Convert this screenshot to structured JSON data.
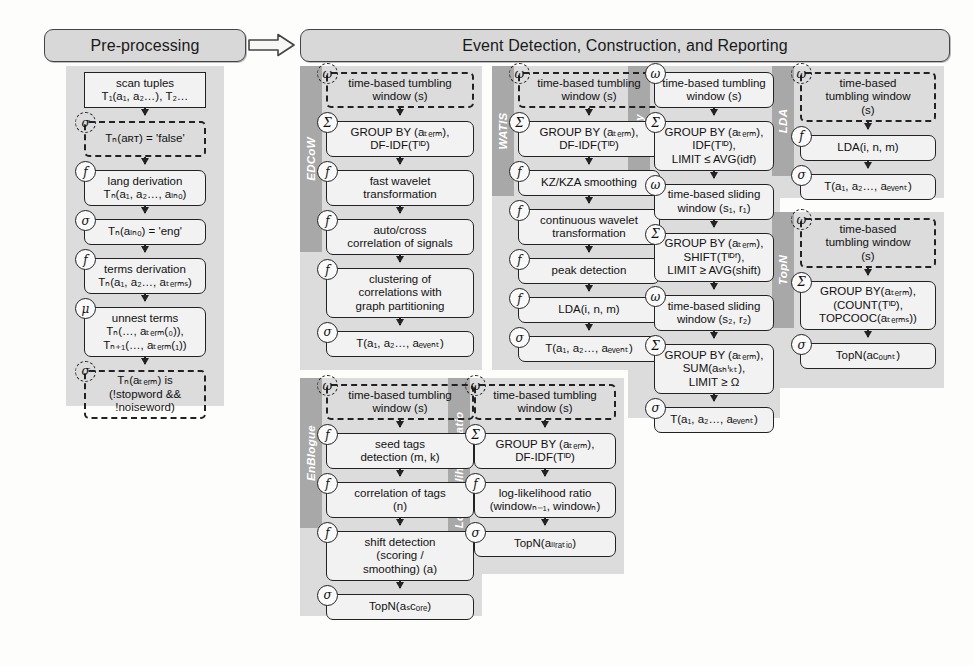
{
  "diagram": {
    "banners": {
      "preprocessing": "Pre-processing",
      "event": "Event Detection, Construction, and Reporting"
    },
    "colors": {
      "banner_fill": "#d8d8d8",
      "group_fill": "#dcdcdc",
      "label_strip": "#a8a8a8",
      "node_fill": "#f2f2f2",
      "stroke": "#222222",
      "label_text": "#ffffff"
    },
    "badges": {
      "sigma_select": "σ",
      "function": "f",
      "mu_unnest": "μ",
      "omega_window": "ω",
      "sum_aggregate": "Σ"
    }
  },
  "preprocessing": {
    "label": "Pre-processing",
    "nodes": [
      {
        "badge": "",
        "shape": "rect",
        "lines": [
          "scan tuples",
          "T₁(a₁, a₂…), T₂…"
        ]
      },
      {
        "badge": "σ",
        "shape": "dashed",
        "lines": [
          "Tₙ(aʀᴛ) = 'false'"
        ]
      },
      {
        "badge": "f",
        "shape": "round",
        "lines": [
          "lang derivation",
          "Tₙ(a₁, a₂…, aₗₙₒ)"
        ]
      },
      {
        "badge": "σ",
        "shape": "round",
        "lines": [
          "Tₙ(aₗₙₒ) = 'eng'"
        ]
      },
      {
        "badge": "f",
        "shape": "round",
        "lines": [
          "terms derivation",
          "Tₙ(a₁, a₂…, aₜₑᵣₘₛ)"
        ]
      },
      {
        "badge": "μ",
        "shape": "round",
        "lines": [
          "unnest terms",
          "Tₙ(…, aₜₑᵣₘ(₀)),",
          "Tₙ₊₁(…, aₜₑᵣₘ(₁))"
        ]
      },
      {
        "badge": "σ",
        "shape": "dashed",
        "lines": [
          "Tₙ(aₜₑᵣₘ) is",
          "(!stopword &&",
          "!noiseword)"
        ]
      }
    ]
  },
  "columns": [
    {
      "id": "edcow",
      "label": "EDCoW",
      "nodes": [
        {
          "badge": "ω",
          "shape": "dashed",
          "lines": [
            "time-based tumbling",
            "window (s)"
          ]
        },
        {
          "badge": "Σ",
          "shape": "round",
          "lines": [
            "GROUP BY (aₜₑᵣₘ),",
            "DF-IDF(Tᴵᴰ)"
          ]
        },
        {
          "badge": "f",
          "shape": "round",
          "lines": [
            "fast wavelet",
            "transformation"
          ]
        },
        {
          "badge": "f",
          "shape": "round",
          "lines": [
            "auto/cross",
            "correlation of signals"
          ]
        },
        {
          "badge": "f",
          "shape": "round",
          "lines": [
            "clustering of",
            "correlations with",
            "graph partitioning"
          ]
        },
        {
          "badge": "σ",
          "shape": "round",
          "lines": [
            "T(a₁, a₂…, aₑᵥₑₙₜ)"
          ]
        }
      ]
    },
    {
      "id": "watis",
      "label": "WATIS",
      "nodes": [
        {
          "badge": "ω",
          "shape": "dashed",
          "lines": [
            "time-based tumbling",
            "window (s)"
          ]
        },
        {
          "badge": "Σ",
          "shape": "round",
          "lines": [
            "GROUP BY (aₜₑᵣₘ),",
            "DF-IDF(Tᴵᴰ)"
          ]
        },
        {
          "badge": "f",
          "shape": "round",
          "lines": [
            "KZ/KZA smoothing"
          ]
        },
        {
          "badge": "f",
          "shape": "round",
          "lines": [
            "continuous wavelet",
            "transformation"
          ]
        },
        {
          "badge": "f",
          "shape": "round",
          "lines": [
            "peak detection"
          ]
        },
        {
          "badge": "f",
          "shape": "round",
          "lines": [
            "LDA(i, n, m)"
          ]
        },
        {
          "badge": "σ",
          "shape": "round",
          "lines": [
            "T(a₁, a₂…, aₑᵥₑₙₜ)"
          ]
        }
      ]
    },
    {
      "id": "shifty",
      "label": "Shifty",
      "nodes": [
        {
          "badge": "ω",
          "shape": "round",
          "lines": [
            "time-based tumbling",
            "window (s)"
          ]
        },
        {
          "badge": "Σ",
          "shape": "round",
          "lines": [
            "GROUP BY (aₜₑᵣₘ),",
            "IDF(Tᴵᴰ),",
            "LIMIT ≤ AVG(idf)"
          ]
        },
        {
          "badge": "ω",
          "shape": "round",
          "lines": [
            "time-based sliding",
            "window (s₁, r₁)"
          ]
        },
        {
          "badge": "Σ",
          "shape": "round",
          "lines": [
            "GROUP BY (aₜₑᵣₘ),",
            "SHIFT(Tᴵᴰᶠ),",
            "LIMIT ≥ AVG(shift)"
          ]
        },
        {
          "badge": "ω",
          "shape": "round",
          "lines": [
            "time-based sliding",
            "window (s₂, r₂)"
          ]
        },
        {
          "badge": "Σ",
          "shape": "round",
          "lines": [
            "GROUP BY (aₜₑᵣₘ),",
            "SUM(aₛₕᶦₖₜ),",
            "LIMIT ≥ Ω"
          ]
        },
        {
          "badge": "σ",
          "shape": "round",
          "lines": [
            "T(a₁, a₂…, aₑᵥₑₙₜ)"
          ]
        }
      ]
    },
    {
      "id": "lda",
      "label": "LDA",
      "nodes": [
        {
          "badge": "ω",
          "shape": "dashed",
          "lines": [
            "time-based",
            "tumbling window",
            "(s)"
          ]
        },
        {
          "badge": "f",
          "shape": "round",
          "lines": [
            "LDA(i, n, m)"
          ]
        },
        {
          "badge": "σ",
          "shape": "round",
          "lines": [
            "T(a₁, a₂…, aₑᵥₑₙₜ)"
          ]
        }
      ]
    },
    {
      "id": "topn",
      "label": "TopN",
      "nodes": [
        {
          "badge": "ω",
          "shape": "dashed",
          "lines": [
            "time-based",
            "tumbling window",
            "(s)"
          ]
        },
        {
          "badge": "Σ",
          "shape": "round",
          "lines": [
            "GROUP BY(aₜₑᵣₘ),",
            "(COUNT(Tᴵᴰ),",
            "TOPCOOC(aₜₑᵣₘₛ))"
          ]
        },
        {
          "badge": "σ",
          "shape": "round",
          "lines": [
            "TopN(aᴄₒᵤₙₜ)"
          ]
        }
      ]
    },
    {
      "id": "enblogue",
      "label": "EnBlogue",
      "nodes": [
        {
          "badge": "ω",
          "shape": "dashed",
          "lines": [
            "time-based tumbling",
            "window (s)"
          ]
        },
        {
          "badge": "f",
          "shape": "round",
          "lines": [
            "seed tags",
            "detection (m, k)"
          ]
        },
        {
          "badge": "f",
          "shape": "round",
          "lines": [
            "correlation of tags",
            "(n)"
          ]
        },
        {
          "badge": "f",
          "shape": "round",
          "lines": [
            "shift detection",
            "(scoring /",
            "smoothing) (a)"
          ]
        },
        {
          "badge": "σ",
          "shape": "round",
          "lines": [
            "TopN(aₛᴄₒᵣₑ)"
          ]
        }
      ]
    },
    {
      "id": "llr",
      "label": "Log-likelihood Ratio",
      "nodes": [
        {
          "badge": "ω",
          "shape": "dashed",
          "lines": [
            "time-based tumbling",
            "window (s)"
          ]
        },
        {
          "badge": "Σ",
          "shape": "round",
          "lines": [
            "GROUP BY (aₜₑᵣₘ),",
            "DF-IDF(Tᴵᴰ)"
          ]
        },
        {
          "badge": "f",
          "shape": "round",
          "lines": [
            "log-likelihood ratio",
            "(windowₙ₋₁, windowₙ)"
          ]
        },
        {
          "badge": "σ",
          "shape": "round",
          "lines": [
            "TopN(aₗₗᵣₐₜᵢₒ)"
          ]
        }
      ]
    }
  ]
}
